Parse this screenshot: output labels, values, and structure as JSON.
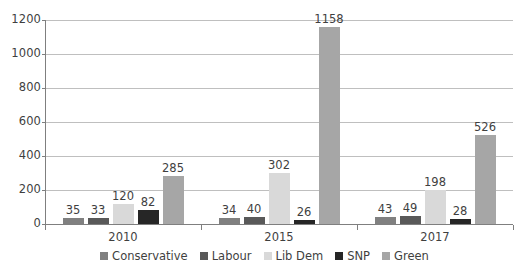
{
  "chart_data": {
    "type": "bar",
    "title": "",
    "subtitle": "",
    "xlabel": "",
    "ylabel": "",
    "categories": [
      "2010",
      "2015",
      "2017"
    ],
    "series": [
      {
        "name": "Conservative",
        "color": "#808080",
        "values": [
          35,
          34,
          43
        ]
      },
      {
        "name": "Labour",
        "color": "#595959",
        "values": [
          33,
          40,
          49
        ]
      },
      {
        "name": "Lib Dem",
        "color": "#d9d9d9",
        "values": [
          120,
          302,
          198
        ]
      },
      {
        "name": "SNP",
        "color": "#262626",
        "values": [
          82,
          26,
          28
        ]
      },
      {
        "name": "Green",
        "color": "#a6a6a6",
        "values": [
          285,
          1158,
          526
        ]
      }
    ],
    "ylim": [
      0,
      1200
    ],
    "y_ticks": [
      0,
      200,
      400,
      600,
      800,
      1000,
      1200
    ],
    "y_tick_labels": [
      "0",
      "200",
      "400",
      "600",
      "800",
      "1000",
      "1200"
    ],
    "grid": true,
    "grid_axis": "y",
    "legend_position": "bottom",
    "data_labels": true,
    "data_label_values": [
      [
        "35",
        "33",
        "120",
        "82",
        "285"
      ],
      [
        "34",
        "40",
        "302",
        "26",
        "1158"
      ],
      [
        "43",
        "49",
        "198",
        "28",
        "526"
      ]
    ]
  },
  "legend": {
    "items": [
      {
        "label": "Conservative",
        "color": "#808080"
      },
      {
        "label": "Labour",
        "color": "#595959"
      },
      {
        "label": "Lib Dem",
        "color": "#d9d9d9"
      },
      {
        "label": "SNP",
        "color": "#262626"
      },
      {
        "label": "Green",
        "color": "#a6a6a6"
      }
    ]
  },
  "axes": {
    "y_tick_labels": [
      "1200",
      "1000",
      "800",
      "600",
      "400",
      "200",
      "0"
    ],
    "x_group_labels": [
      "2010",
      "2015",
      "2017"
    ]
  }
}
